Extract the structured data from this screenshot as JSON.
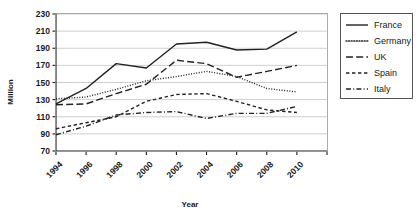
{
  "chart_data": {
    "type": "line",
    "title": "",
    "xlabel": "Year",
    "ylabel": "Million",
    "x": [
      1994,
      1996,
      1998,
      2000,
      2002,
      2004,
      2006,
      2008,
      2010
    ],
    "xtick_labels": [
      "1994",
      "1996",
      "1998",
      "2000",
      "2002",
      "2004",
      "2006",
      "2008",
      "2010"
    ],
    "ytick_labels": [
      "70",
      "90",
      "110",
      "130",
      "150",
      "170",
      "190",
      "210",
      "230"
    ],
    "yticks": [
      70,
      90,
      110,
      130,
      150,
      170,
      190,
      210,
      230
    ],
    "ylim": [
      70,
      230
    ],
    "xlim": [
      1994,
      2011
    ],
    "grid": true,
    "legend_position": "right",
    "series": [
      {
        "name": "France",
        "style": "solid",
        "color": "#222222",
        "values": [
          125,
          143,
          172,
          167,
          195,
          197,
          188,
          189,
          209
        ]
      },
      {
        "name": "Germany",
        "style": "dotted",
        "color": "#222222",
        "values": [
          131,
          133,
          142,
          152,
          157,
          163,
          157,
          143,
          139
        ]
      },
      {
        "name": "UK",
        "style": "long-dash",
        "color": "#222222",
        "values": [
          124,
          125,
          137,
          148,
          176,
          172,
          156,
          163,
          170
        ]
      },
      {
        "name": "Spain",
        "style": "short-dash",
        "color": "#222222",
        "values": [
          96,
          103,
          110,
          128,
          136,
          137,
          128,
          118,
          115
        ]
      },
      {
        "name": "Italy",
        "style": "dash-dot",
        "color": "#222222",
        "values": [
          89,
          99,
          112,
          115,
          116,
          108,
          114,
          114,
          122
        ]
      }
    ]
  },
  "legend": {
    "entries": [
      "France",
      "Germany",
      "UK",
      "Spain",
      "Italy"
    ]
  },
  "axes": {
    "y_title": "Million",
    "x_title": "Year"
  }
}
